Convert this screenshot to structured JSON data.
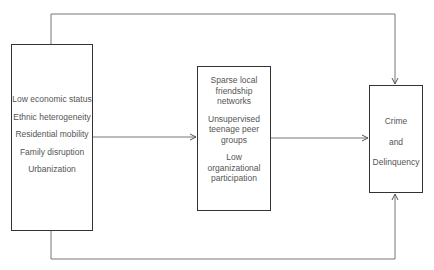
{
  "diagram": {
    "nodes": {
      "left": {
        "items": [
          "Low economic status",
          "Ethnic heterogeneity",
          "Residential mobility",
          "Family disruption",
          "Urbanization"
        ]
      },
      "middle": {
        "groups": [
          [
            "Sparse local",
            "friendship",
            "networks"
          ],
          [
            "Unsupervised",
            "teenage peer",
            "groups"
          ],
          [
            "Low",
            "organizational",
            "participation"
          ]
        ]
      },
      "right": {
        "items": [
          "Crime",
          "and",
          "Delinquency"
        ]
      }
    },
    "edges": [
      {
        "from": "left",
        "to": "middle",
        "type": "direct-arrow"
      },
      {
        "from": "middle",
        "to": "right",
        "type": "direct-arrow"
      },
      {
        "from": "left",
        "to": "right",
        "type": "over-top-arrow"
      },
      {
        "from": "left",
        "to": "right",
        "type": "under-bottom-arrow"
      }
    ],
    "colors": {
      "line": "#666666",
      "box_border": "#333333",
      "text": "#555555"
    }
  }
}
